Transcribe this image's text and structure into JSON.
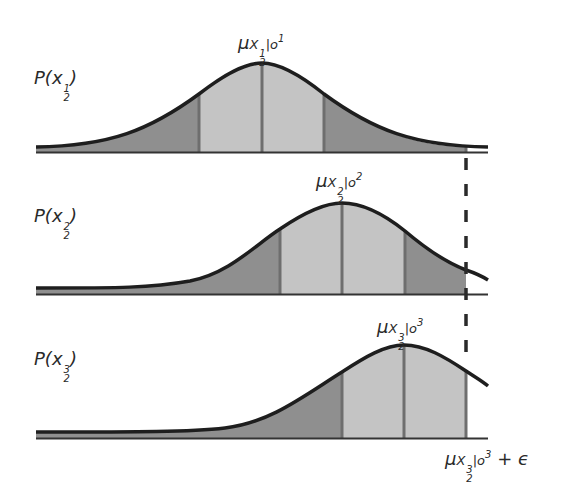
{
  "diagram": {
    "type": "stacked-gaussian-distributions",
    "colors": {
      "curve": "#1e1e1e",
      "axis": "#333333",
      "outer_fill": "#8f8f8f",
      "inner_fill": "#c4c4c4",
      "divider": "#6e6e6e",
      "threshold": "#2a2a2a"
    },
    "plots": [
      {
        "id": "plot-1",
        "probability_label": {
          "base": "P(x",
          "sub": "2",
          "sup": "1",
          "close": ")"
        },
        "mean_label": {
          "mu": "μ",
          "x": "X",
          "x_sub": "2",
          "x_sup": "1",
          "given": "|o",
          "given_sup": "1"
        },
        "baseline_y": 152,
        "peak_x": 262,
        "peak_y": 63,
        "dividers_x": [
          199,
          262,
          324
        ]
      },
      {
        "id": "plot-2",
        "probability_label": {
          "base": "P(x",
          "sub": "2",
          "sup": "2",
          "close": ")"
        },
        "mean_label": {
          "mu": "μ",
          "x": "X",
          "x_sub": "2",
          "x_sup": "2",
          "given": "|o",
          "given_sup": "2"
        },
        "baseline_y": 294,
        "peak_x": 342,
        "peak_y": 203,
        "dividers_x": [
          280,
          342,
          405,
          466
        ]
      },
      {
        "id": "plot-3",
        "probability_label": {
          "base": "P(x",
          "sub": "2",
          "sup": "3",
          "close": ")"
        },
        "mean_label": {
          "mu": "μ",
          "x": "X",
          "x_sub": "2",
          "x_sup": "3",
          "given": "|o",
          "given_sup": "3"
        },
        "baseline_y": 438,
        "peak_x": 404,
        "peak_y": 345,
        "dividers_x": [
          342,
          404,
          466
        ]
      }
    ],
    "threshold": {
      "x": 466,
      "style": "dashed",
      "label": {
        "mu": "μ",
        "x": "X",
        "x_sub": "2",
        "x_sup": "3",
        "given": "|o",
        "given_sup": "3",
        "suffix": " + ϵ"
      }
    }
  }
}
